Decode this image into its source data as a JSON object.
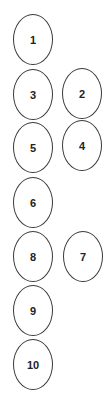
{
  "diagram": {
    "nodes": [
      {
        "label": "1",
        "cx": 33,
        "cy": 40
      },
      {
        "label": "2",
        "cx": 82,
        "cy": 94
      },
      {
        "label": "3",
        "cx": 33,
        "cy": 95
      },
      {
        "label": "4",
        "cx": 82,
        "cy": 146
      },
      {
        "label": "5",
        "cx": 33,
        "cy": 148
      },
      {
        "label": "6",
        "cx": 33,
        "cy": 203
      },
      {
        "label": "7",
        "cx": 83,
        "cy": 257
      },
      {
        "label": "8",
        "cx": 33,
        "cy": 257
      },
      {
        "label": "9",
        "cx": 33,
        "cy": 311
      },
      {
        "label": "10",
        "cx": 33,
        "cy": 365
      }
    ],
    "stroke_color": "#3a3a3a",
    "text_color": "#222222"
  }
}
